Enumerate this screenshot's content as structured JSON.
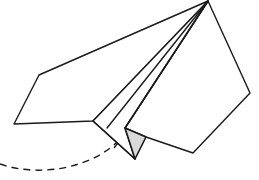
{
  "diagram": {
    "colors": {
      "line": "#1a1a1a",
      "background": "#ffffff",
      "shaded_fold": "#d9d9d9"
    },
    "parts": [
      "left-wing",
      "right-wing",
      "center-fold-lines",
      "keel-shaded-triangle",
      "flight-path-dashed"
    ]
  }
}
